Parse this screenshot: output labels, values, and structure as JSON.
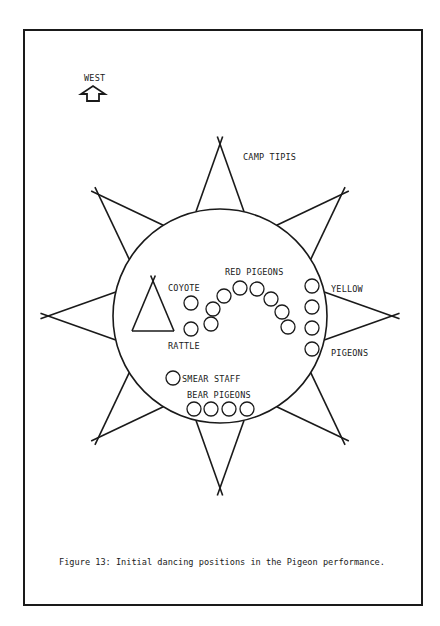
{
  "figure": {
    "caption": "Figure 13: Initial dancing positions in the Pigeon performance.",
    "frame": {
      "x": 24,
      "y": 30,
      "w": 398,
      "h": 575
    },
    "stroke_color": "#1a1a1a",
    "background": "#ffffff"
  },
  "compass": {
    "label": "WEST",
    "label_pos": {
      "x": 84,
      "y": 81
    },
    "arrow": {
      "cx": 93,
      "base_y": 101,
      "tip_y": 86
    },
    "icon": "up-arrow-icon"
  },
  "camp": {
    "label": "CAMP TIPIS",
    "label_pos": {
      "x": 243,
      "y": 160
    },
    "center": {
      "x": 220,
      "y": 316
    },
    "radius": 107,
    "tipis": [
      {
        "angle": -90
      },
      {
        "angle": -45
      },
      {
        "angle": 0
      },
      {
        "angle": 45
      },
      {
        "angle": 90
      },
      {
        "angle": 135
      },
      {
        "angle": 180
      },
      {
        "angle": -135
      }
    ],
    "tipi_half_width_deg": 13,
    "tipi_tip_radius": 172
  },
  "inner_tipi": {
    "apex": {
      "x": 153,
      "y": 281
    },
    "left": {
      "x": 132,
      "y": 331
    },
    "right": {
      "x": 174,
      "y": 331
    }
  },
  "labels": {
    "coyote": {
      "text": "COYOTE",
      "x": 168,
      "y": 291
    },
    "rattle": {
      "text": "RATTLE",
      "x": 168,
      "y": 349
    },
    "red_pigeons": {
      "text": "RED PIGEONS",
      "x": 225,
      "y": 275
    },
    "yellow": {
      "text": "YELLOW",
      "x": 331,
      "y": 292
    },
    "pigeons": {
      "text": "PIGEONS",
      "x": 331,
      "y": 356
    },
    "smear_staff": {
      "text": "SMEAR STAFF",
      "x": 182,
      "y": 382
    },
    "bear_pigeons": {
      "text": "BEAR PIGEONS",
      "x": 187,
      "y": 398
    }
  },
  "dancers": {
    "radius": 7,
    "coyote": [
      {
        "x": 191,
        "y": 303
      }
    ],
    "rattle": [
      {
        "x": 191,
        "y": 329
      }
    ],
    "red_pigeons": [
      {
        "x": 211,
        "y": 324
      },
      {
        "x": 213,
        "y": 309
      },
      {
        "x": 224,
        "y": 296
      },
      {
        "x": 240,
        "y": 288
      },
      {
        "x": 257,
        "y": 289
      },
      {
        "x": 271,
        "y": 299
      },
      {
        "x": 282,
        "y": 312
      },
      {
        "x": 288,
        "y": 327
      }
    ],
    "yellow_pigeons": [
      {
        "x": 312,
        "y": 286
      },
      {
        "x": 312,
        "y": 307
      },
      {
        "x": 312,
        "y": 328
      },
      {
        "x": 312,
        "y": 349
      }
    ],
    "smear_staff": [
      {
        "x": 173,
        "y": 378
      }
    ],
    "bear_pigeons": [
      {
        "x": 194,
        "y": 409
      },
      {
        "x": 211,
        "y": 409
      },
      {
        "x": 229,
        "y": 409
      },
      {
        "x": 247,
        "y": 409
      }
    ]
  }
}
